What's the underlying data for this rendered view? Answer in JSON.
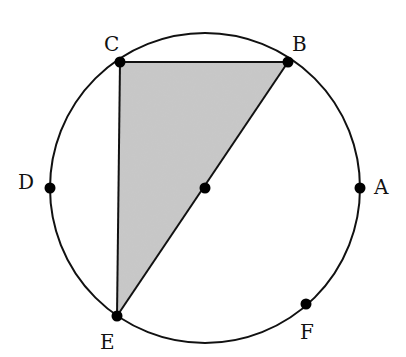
{
  "diagram": {
    "type": "circle-inscribed-triangle",
    "circle": {
      "cx": 205,
      "cy": 188,
      "r": 155,
      "stroke": "#111111"
    },
    "center_point": {
      "x": 205,
      "y": 188
    },
    "points": [
      {
        "label": "A",
        "x": 360,
        "y": 188,
        "label_x": 374,
        "label_y": 177
      },
      {
        "label": "B",
        "x": 288,
        "y": 62,
        "label_x": 292,
        "label_y": 34
      },
      {
        "label": "C",
        "x": 120,
        "y": 62,
        "label_x": 104,
        "label_y": 34
      },
      {
        "label": "D",
        "x": 50,
        "y": 188,
        "label_x": 18,
        "label_y": 172
      },
      {
        "label": "E",
        "x": 117,
        "y": 316,
        "label_x": 100,
        "label_y": 332
      },
      {
        "label": "F",
        "x": 306,
        "y": 304,
        "label_x": 300,
        "label_y": 322
      }
    ],
    "shaded_triangle": {
      "vertices": [
        "C",
        "B",
        "E"
      ],
      "fill": "#c8c8c8"
    },
    "segments": [
      [
        "C",
        "B"
      ],
      [
        "C",
        "E"
      ],
      [
        "B",
        "E"
      ]
    ]
  }
}
